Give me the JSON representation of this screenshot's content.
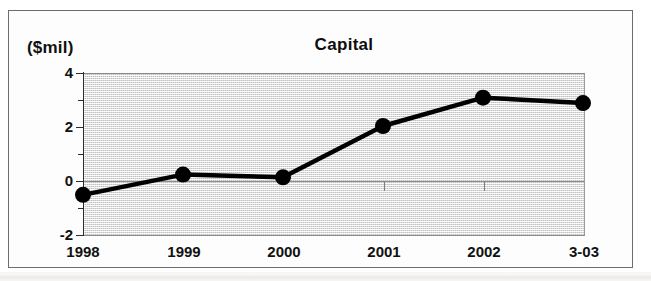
{
  "figure": {
    "unit_label": "($mil)",
    "title": "Capital"
  },
  "chart_data": {
    "type": "line",
    "title": "Capital",
    "subtitle": "",
    "xlabel": "",
    "ylabel": "($mil)",
    "unit": "$mil",
    "categories": [
      "1998",
      "1999",
      "2000",
      "2001",
      "2002",
      "3-03"
    ],
    "values": [
      -0.55,
      0.2,
      0.1,
      2.0,
      3.05,
      2.85
    ],
    "series": [
      {
        "name": "Capital",
        "values": [
          -0.55,
          0.2,
          0.1,
          2.0,
          3.05,
          2.85
        ]
      }
    ],
    "ylim": [
      -2,
      4
    ],
    "yticks": [
      4,
      2,
      0,
      -2
    ],
    "yticks_minor": [
      3,
      1,
      -1
    ],
    "ytick_labels": [
      "4",
      "2",
      "0",
      "-2"
    ],
    "xtick_labels": [
      "1998",
      "1999",
      "2000",
      "2001",
      "2002",
      "3-03"
    ],
    "grid": false,
    "zero_line": true,
    "legend": "none",
    "marker": "filled-circle",
    "line_color": "#000000",
    "marker_color": "#000000",
    "plot_background": "#e9e9e9",
    "frame_color": "#6d6d6d"
  },
  "axis": {
    "y_labels": [
      "4",
      "2",
      "0",
      "-2"
    ],
    "x_labels": [
      "1998",
      "1999",
      "2000",
      "2001",
      "2002",
      "3-03"
    ]
  }
}
